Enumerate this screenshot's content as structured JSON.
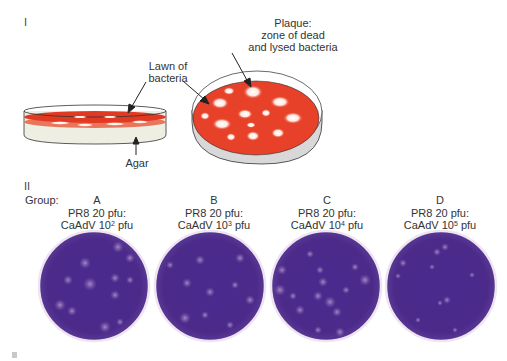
{
  "panel_I": {
    "label": "I",
    "annotations": {
      "plaque_line1": "Plaque:",
      "plaque_line2": "zone of dead",
      "plaque_line3": "and lysed bacteria",
      "lawn_line1": "Lawn of",
      "lawn_line2": "bacteria",
      "agar": "Agar"
    },
    "colors": {
      "lawn": "#e8412a",
      "plaque": "#fff4ee",
      "agar": "#eeeee0",
      "dish_side": "#d8d8d8"
    }
  },
  "panel_II": {
    "label": "II",
    "group_header": "Group:",
    "groups": [
      {
        "letter": "A",
        "line1": "PR8 20 pfu:",
        "virus": "CaAdV 10",
        "exp": "2",
        "unit": " pfu"
      },
      {
        "letter": "B",
        "line1": "PR8 20 pfu:",
        "virus": "CaAdV 10",
        "exp": "3",
        "unit": " pfu"
      },
      {
        "letter": "C",
        "line1": "PR8 20 pfu:",
        "virus": "CaAdV 10",
        "exp": "4",
        "unit": " pfu"
      },
      {
        "letter": "D",
        "line1": "PR8 20 pfu:",
        "virus": "CaAdV 10",
        "exp": "5",
        "unit": " pfu"
      }
    ],
    "colors": {
      "plate_stain": "#4a2a8a",
      "plaque_spot": "#a985c4"
    }
  }
}
